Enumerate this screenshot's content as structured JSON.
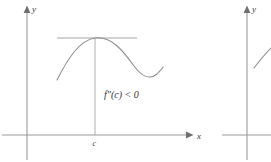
{
  "figures": [
    {
      "id": "figure-left",
      "axes": {
        "x_label": "x",
        "y_label": "y",
        "x_axis_y": 135,
        "y_axis_x": 27,
        "x_axis_start": 2,
        "x_axis_end": 190,
        "y_axis_top": 8,
        "y_axis_bottom": 160
      },
      "tick": {
        "label": "c",
        "x": 95
      },
      "annotation": {
        "text": "f″(c) < 0",
        "x": 104,
        "y": 95
      },
      "tangent_line": {
        "x_start": 57,
        "x_end": 137,
        "y": 38
      },
      "curve": {
        "description": "concave down curve with local maximum at c",
        "path": "M 57,80 C 68,58 80,40 95,38 C 112,36 124,52 134,66 C 142,77 150,80 157,74 C 160,71 162,69 163,67"
      },
      "vertical_line": {
        "x": 95,
        "y_top": 38,
        "y_bottom": 135
      }
    },
    {
      "id": "figure-right",
      "axes": {
        "y_label": "y",
        "x_axis_y": 135,
        "y_axis_x": 247,
        "x_axis_start": 222,
        "x_axis_end": 271,
        "y_axis_top": 8,
        "y_axis_bottom": 160
      },
      "curve": {
        "description": "rising curve fragment",
        "path": "M 254,68 C 260,60 266,53 271,48"
      }
    }
  ],
  "colors": {
    "axis": "#9a9a9a",
    "curve": "#8c8c8c",
    "tangent": "#9a9a9a",
    "vertical_line": "#a8a8a8",
    "text": "#333333",
    "background": "#ffffff"
  }
}
